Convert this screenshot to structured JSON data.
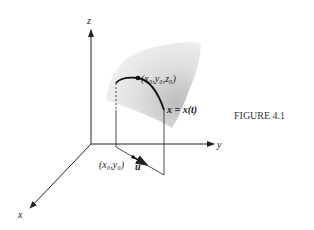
{
  "figure": {
    "caption": "FIGURE 4.1",
    "axes": {
      "z": "z",
      "y": "y",
      "x": "x"
    },
    "point_3d": {
      "label": "(x₀,y₀,z₀)"
    },
    "curve": {
      "label": "x = x(t)"
    },
    "point_2d": {
      "label": "(x₀,y₀)"
    },
    "vector": {
      "label": "u"
    },
    "colors": {
      "ink": "#222222",
      "surface_light": "#f2f2f2",
      "surface_dark": "#bdbdbd"
    }
  }
}
